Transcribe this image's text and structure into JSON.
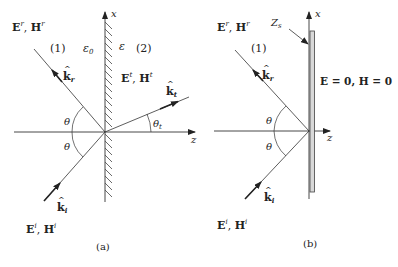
{
  "panel_a": {
    "caption": "(a)",
    "reflected_fields": "E",
    "reflected_sup_e": "r",
    "reflected_h": "H",
    "reflected_sup_h": "r",
    "region1": "(1)",
    "region2": "(2)",
    "eps0": "ε",
    "eps0_sub": "0",
    "eps": "ε",
    "transmitted_e": "E",
    "transmitted_sup_e": "t",
    "transmitted_h": "H",
    "transmitted_sup_h": "t",
    "k_r": "k",
    "k_r_sub": "r",
    "k_t": "k",
    "k_t_sub": "t",
    "k_i": "k",
    "k_i_sub": "i",
    "theta": "θ",
    "theta_t": "θ",
    "theta_t_sub": "t",
    "x_axis": "x",
    "z_axis": "z",
    "incident_e": "E",
    "incident_sup_e": "i",
    "incident_h": "H",
    "incident_sup_h": "i",
    "sep": ", "
  },
  "panel_b": {
    "caption": "(b)",
    "reflected_e": "E",
    "reflected_sup_e": "r",
    "reflected_h": "H",
    "reflected_sup_h": "r",
    "region1": "(1)",
    "zs": "Z",
    "zs_sub": "s",
    "zero_fields": "E = 0, H = 0",
    "k_r": "k",
    "k_r_sub": "r",
    "k_i": "k",
    "k_i_sub": "i",
    "theta": "θ",
    "x_axis": "x",
    "z_axis": "z",
    "incident_e": "E",
    "incident_sup_e": "i",
    "incident_h": "H",
    "incident_sup_h": "i",
    "sep": ", "
  }
}
